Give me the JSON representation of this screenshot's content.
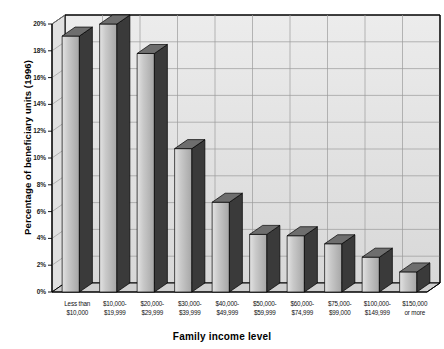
{
  "chart_data": {
    "type": "bar",
    "title": "",
    "xlabel": "Family income level",
    "ylabel": "Percentage of beneficiary units (1996)",
    "ylim": [
      0,
      20
    ],
    "ytick_labels": [
      "0%",
      "2%",
      "4%",
      "6%",
      "8%",
      "10%",
      "12%",
      "14%",
      "16%",
      "18%",
      "20%"
    ],
    "ytick_values": [
      0,
      2,
      4,
      6,
      8,
      10,
      12,
      14,
      16,
      18,
      20
    ],
    "grid": true,
    "legend": "none",
    "style": "3d-column",
    "categories": [
      "Less than $10,000",
      "$10,000-$19,999",
      "$20,000-$29,999",
      "$30,000-$39,999",
      "$40,000-$49,999",
      "$50,000-$59,999",
      "$60,000-$74,999",
      "$75,000-$99,000",
      "$100,000-$149,999",
      "$150,000 or more"
    ],
    "category_lines": [
      [
        "Less than",
        "$10,000"
      ],
      [
        "$10,000-",
        "$19,999"
      ],
      [
        "$20,000-",
        "$29,999"
      ],
      [
        "$30,000-",
        "$39,999"
      ],
      [
        "$40,000-",
        "$49,999"
      ],
      [
        "$50,000-",
        "$59,999"
      ],
      [
        "$60,000-",
        "$74,999"
      ],
      [
        "$75,000-",
        "$99,000"
      ],
      [
        "$100,000-",
        "$149,999"
      ],
      [
        "$150,000",
        "or more"
      ]
    ],
    "values": [
      19.1,
      20.0,
      17.8,
      10.7,
      6.7,
      4.3,
      4.2,
      3.6,
      2.6,
      1.5
    ],
    "colors": {
      "bar_face_light": "#d2d2d2",
      "bar_face_dark": "#9a9a9a",
      "bar_side": "#3a3a3a",
      "bar_top": "#6e6e6e",
      "plot_floor": "#cfcfcf",
      "plot_back": "#e8e8e8",
      "plot_wall": "#dcdcdc",
      "axis_line": "#000000",
      "grid_line": "#9b9b9b",
      "text": "#000000"
    }
  }
}
